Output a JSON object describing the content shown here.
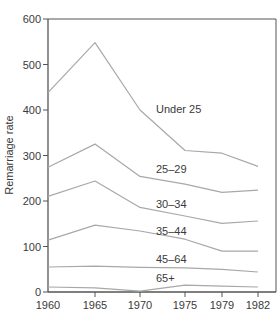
{
  "chart_data": {
    "type": "line",
    "title": "",
    "xlabel": "",
    "ylabel": "Remarriage rate",
    "x": [
      1960,
      1965,
      1970,
      1975,
      1979,
      1982
    ],
    "x_tick_labels": [
      "1960",
      "1965",
      "1970",
      "1975",
      "1979",
      "1982"
    ],
    "y_ticks": [
      0,
      100,
      200,
      300,
      400,
      500,
      600
    ],
    "y_tick_labels": [
      "0",
      "100",
      "200",
      "300",
      "400",
      "500",
      "600"
    ],
    "ylim": [
      0,
      600
    ],
    "grid": false,
    "legend": "inline labels",
    "series": [
      {
        "name": "Under 25",
        "values": [
          438,
          548,
          400,
          311,
          305,
          276
        ]
      },
      {
        "name": "25–29",
        "values": [
          274,
          325,
          254,
          237,
          219,
          224
        ]
      },
      {
        "name": "30–34",
        "values": [
          210,
          244,
          186,
          167,
          151,
          156
        ]
      },
      {
        "name": "35–44",
        "values": [
          114,
          147,
          134,
          116,
          90,
          90
        ]
      },
      {
        "name": "45–64",
        "values": [
          55,
          57,
          54,
          53,
          50,
          44
        ]
      },
      {
        "name": "65+",
        "values": [
          11,
          9,
          2,
          15,
          13,
          11
        ]
      }
    ],
    "line_color": "#a8a8a8",
    "axis_color": "#555555"
  },
  "labels": {
    "ylabel": "Remarriage rate",
    "series": [
      "Under 25",
      "25–29",
      "30–34",
      "35–44",
      "45–64",
      "65+"
    ]
  }
}
